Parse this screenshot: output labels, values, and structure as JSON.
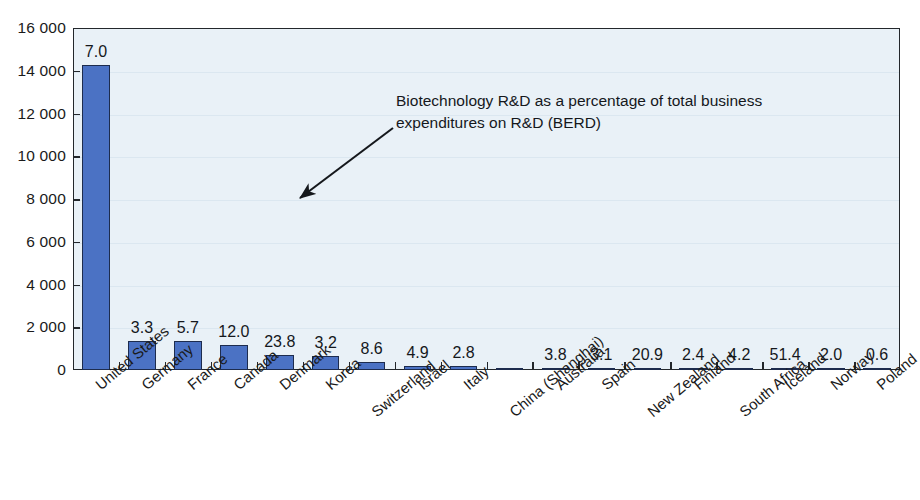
{
  "chart_data": {
    "type": "bar",
    "title": "",
    "xlabel": "",
    "ylabel": "",
    "ylim": [
      0,
      16000
    ],
    "ytick_step": 2000,
    "ytick_labels": [
      "16 000",
      "14 000",
      "12 000",
      "10 000",
      "8 000",
      "6 000",
      "4 000",
      "2 000",
      "0"
    ],
    "ytick_values": [
      16000,
      14000,
      12000,
      10000,
      8000,
      6000,
      4000,
      2000,
      0
    ],
    "grid": true,
    "legend": "none",
    "categories": [
      "United States",
      "Germany",
      "France",
      "Canada",
      "Denmark",
      "Korea",
      "Switzerland",
      "Israel",
      "Italy",
      "China (Shanghai)",
      "Australia",
      "Spain",
      "New Zealand",
      "Finland",
      "South Africa",
      "Iceland",
      "Norway",
      "Poland"
    ],
    "series": [
      {
        "name": "Biotechnology R&D expenditures",
        "values": [
          14250,
          1360,
          1350,
          1160,
          700,
          650,
          370,
          200,
          180,
          110,
          115,
          105,
          55,
          50,
          45,
          40,
          15,
          10
        ]
      }
    ],
    "data_labels": [
      "7.0",
      "3.3",
      "5.7",
      "12.0",
      "23.8",
      "3.2",
      "8.6",
      "4.9",
      "2.8",
      "",
      "3.8",
      "3.1",
      "20.9",
      "2.4",
      "4.2",
      "51.4",
      "2.0",
      "0.6"
    ],
    "data_labels_meaning": "Biotechnology R&D as a percentage of total business expenditures on R&D (BERD)",
    "annotation": {
      "text": "Biotechnology R&D as a percentage of total business expenditures on R&D (BERD)",
      "line1": "Biotechnology R&D as a percentage of total business",
      "line2": "expenditures on R&D (BERD)",
      "arrow": "points down-left toward the data labels"
    },
    "colors": {
      "bar_fill": "#4b72c4",
      "bar_outline": "#1d2c4e",
      "plot_background": "#e9f1f7",
      "axis": "#23272b",
      "gridline": "#dbe7f0",
      "text": "#15181c"
    }
  }
}
